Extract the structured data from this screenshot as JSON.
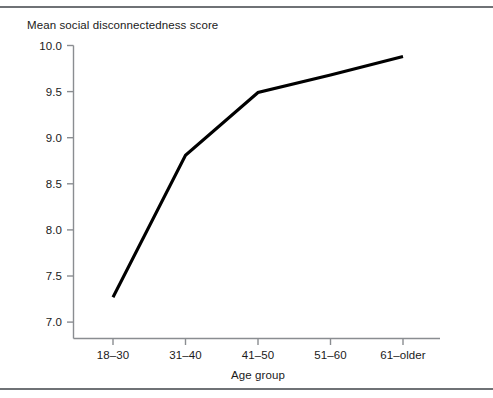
{
  "figure": {
    "background_color": "#ffffff",
    "rule_color": "#6f7276",
    "title": "Mean social disconnectedness score"
  },
  "chart_data": {
    "type": "line",
    "title": "Mean social disconnectedness score",
    "xlabel": "Age group",
    "ylabel": "Mean social disconnectedness score",
    "categories": [
      "18–30",
      "31–40",
      "41–50",
      "51–60",
      "61–older"
    ],
    "values": [
      7.27,
      8.81,
      9.49,
      9.68,
      9.88
    ],
    "series": [
      {
        "name": "Mean social disconnectedness score",
        "values": [
          7.27,
          8.81,
          9.49,
          9.68,
          9.88
        ],
        "color": "#000000",
        "line_width": 3,
        "markers": false
      }
    ],
    "ylim": [
      7.0,
      10.0
    ],
    "yticks": [
      7.0,
      7.5,
      8.0,
      8.5,
      9.0,
      9.5,
      10.0
    ],
    "ytick_labels": [
      "7.0",
      "7.5",
      "8.0",
      "8.5",
      "9.0",
      "9.5",
      "10.0"
    ],
    "xtick_labels": [
      "18–30",
      "31–40",
      "41–50",
      "51–60",
      "61–older"
    ],
    "grid": false,
    "legend": false,
    "legend_position": "none",
    "axis_color": "#8a8d91",
    "spines": [
      "left",
      "bottom"
    ]
  },
  "axes": {
    "y_title": "Mean social disconnectedness score",
    "x_title": "Age group",
    "y_labels": [
      "10.0",
      "9.5",
      "9.0",
      "8.5",
      "8.0",
      "7.5",
      "7.0"
    ],
    "x_labels": [
      "18–30",
      "31–40",
      "41–50",
      "51–60",
      "61–older"
    ]
  }
}
